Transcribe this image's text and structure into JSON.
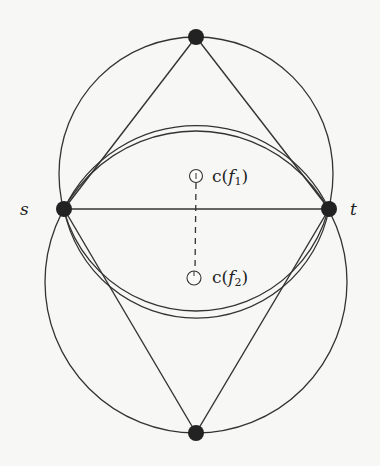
{
  "labels": {
    "s": "s",
    "t": "t",
    "c1": {
      "prefix": "c(",
      "var": "f",
      "sub": "1",
      "suffix": ")"
    },
    "c2": {
      "prefix": "c(",
      "var": "f",
      "sub": "2",
      "suffix": ")"
    }
  },
  "vertices": {
    "s": {
      "x": 64,
      "y": 209
    },
    "t": {
      "x": 329,
      "y": 209
    },
    "top": {
      "x": 196,
      "y": 37
    },
    "bottom": {
      "x": 196,
      "y": 433
    }
  },
  "face_centers": {
    "c_f1": {
      "x": 196,
      "y": 176
    },
    "c_f2": {
      "x": 194,
      "y": 278
    }
  },
  "colors": {
    "stroke": "#333333",
    "vertex": "#222222",
    "background": "#f7f7f5"
  }
}
